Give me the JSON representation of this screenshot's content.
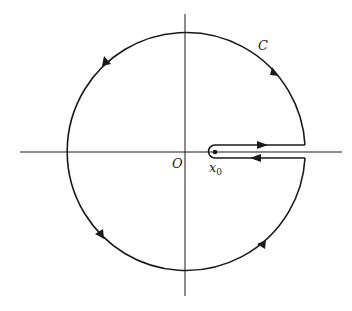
{
  "diagram": {
    "labels": {
      "contour": "C",
      "origin": "O",
      "point_base": "x",
      "point_sub": "0"
    },
    "colors": {
      "stroke": "#1a1a1a",
      "background": "#ffffff"
    },
    "geometry": {
      "center": [
        185,
        151
      ],
      "radius": 119,
      "branch_point": [
        215,
        152
      ],
      "cut_gap_upper_y": 145,
      "cut_gap_lower_y": 158,
      "cut_end_x": 305
    },
    "arrows": [
      {
        "position": "upper-right",
        "direction": "counterclockwise"
      },
      {
        "position": "upper-left",
        "direction": "counterclockwise"
      },
      {
        "position": "lower-left",
        "direction": "counterclockwise"
      },
      {
        "position": "lower-right",
        "direction": "counterclockwise"
      },
      {
        "position": "cut-upper",
        "direction": "right"
      },
      {
        "position": "cut-lower",
        "direction": "left"
      }
    ]
  }
}
